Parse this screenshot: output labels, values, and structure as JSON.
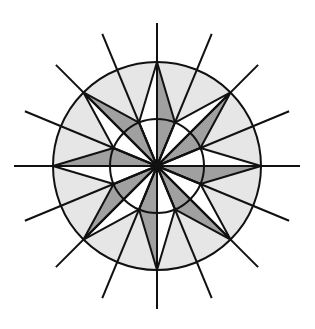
{
  "figure": {
    "title": "Compass rose star inside two concentric circles with 16 radiating lines",
    "center": [
      157,
      166
    ],
    "outer_radius": 104,
    "inner_radius": 47,
    "ray_length": 143,
    "ray_count": 16,
    "star_points": 8,
    "colors": {
      "background": "#ffffff",
      "ring_fill": "#e6e6e6",
      "inner_fill": "#ffffff",
      "arm_dark": "#a0a0a0",
      "arm_light": "#ffffff",
      "stroke": "#111111"
    },
    "stroke_width": 2
  }
}
